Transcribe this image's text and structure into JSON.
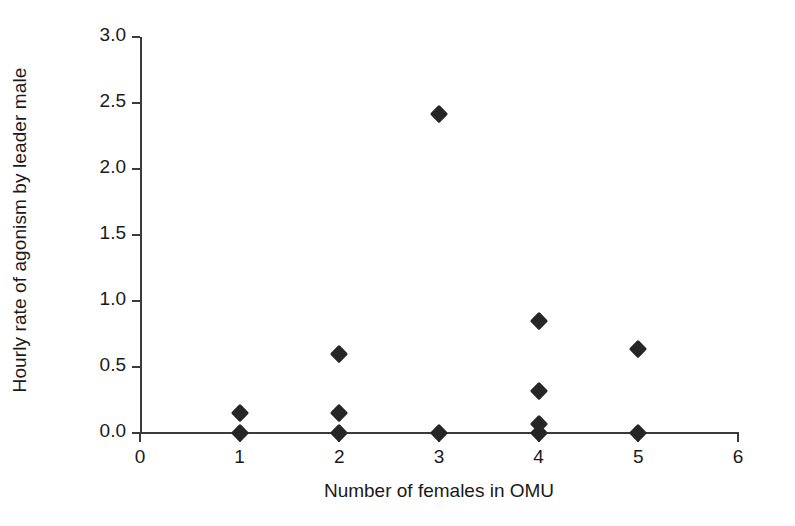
{
  "chart_data": {
    "type": "scatter",
    "title": "",
    "xlabel": "Number of females in OMU",
    "ylabel": "Hourly rate of agonism by leader male",
    "xlim": [
      0,
      6
    ],
    "ylim": [
      0.0,
      3.0
    ],
    "xticks": [
      0,
      1,
      2,
      3,
      4,
      5,
      6
    ],
    "xtick_labels": [
      "0",
      "1",
      "2",
      "3",
      "4",
      "5",
      "6"
    ],
    "yticks": [
      0.0,
      0.5,
      1.0,
      1.5,
      2.0,
      2.5,
      3.0
    ],
    "ytick_labels": [
      "0.0",
      "0.5",
      "1.0",
      "1.5",
      "2.0",
      "2.5",
      "3.0"
    ],
    "grid": false,
    "legend": false,
    "marker": "filled-diamond",
    "marker_color": "#262626",
    "axis_color": "#3a3a3a",
    "background": "#ffffff",
    "points": [
      {
        "x": 1,
        "y": 0.0
      },
      {
        "x": 1,
        "y": 0.15
      },
      {
        "x": 2,
        "y": 0.0
      },
      {
        "x": 2,
        "y": 0.15
      },
      {
        "x": 2,
        "y": 0.6
      },
      {
        "x": 3,
        "y": 0.0
      },
      {
        "x": 3,
        "y": 2.42
      },
      {
        "x": 4,
        "y": 0.0
      },
      {
        "x": 4,
        "y": 0.07
      },
      {
        "x": 4,
        "y": 0.32
      },
      {
        "x": 4,
        "y": 0.85
      },
      {
        "x": 5,
        "y": 0.0
      },
      {
        "x": 5,
        "y": 0.64
      }
    ]
  }
}
